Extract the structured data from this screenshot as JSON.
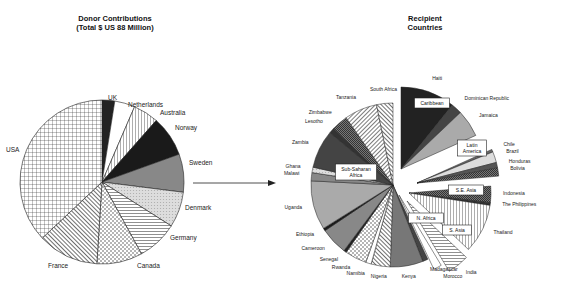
{
  "chart_data": [
    {
      "type": "pie",
      "title": "Donor Contributions",
      "subtitle": "(Total $ US 88 Million)",
      "categories": [
        "UK",
        "Netherlands",
        "Australia",
        "Norway",
        "Sweden",
        "Denmark",
        "Germany",
        "Canada",
        "France",
        "USA"
      ],
      "values": [
        2.5,
        4,
        5,
        8,
        7.5,
        7,
        8,
        9,
        12,
        37
      ],
      "unit": "percent (estimated)",
      "legend": "none (labels beside slices)"
    },
    {
      "type": "pie",
      "title": "Recipient Countries",
      "groups": [
        "Caribbean",
        "Latin America",
        "S.E. Asia",
        "S. Asia",
        "N. Africa",
        "Sub-Saharan Africa"
      ],
      "categories": [
        "Haiti",
        "Dominican Republic",
        "Jamaica",
        "Chile",
        "Brazil",
        "Honduras",
        "Bolivia",
        "Indonesia",
        "The Philippines",
        "Thailand",
        "India",
        "Morocco",
        "Madagascar",
        "Kenya",
        "Nigeria",
        "Namibia",
        "Rwanda",
        "Senegal",
        "Cameroon",
        "Ethiopia",
        "Uganda",
        "Malawi",
        "Ghana",
        "Zambia",
        "Lesotho",
        "Zimbabwe",
        "Tanzania",
        "South Africa"
      ],
      "group_of": [
        "Caribbean",
        "Caribbean",
        "Caribbean",
        "Latin America",
        "Latin America",
        "Latin America",
        "Latin America",
        "S.E. Asia",
        "S.E. Asia",
        "S.E. Asia",
        "S. Asia",
        "N. Africa",
        "Sub-Saharan Africa",
        "Sub-Saharan Africa",
        "Sub-Saharan Africa",
        "Sub-Saharan Africa",
        "Sub-Saharan Africa",
        "Sub-Saharan Africa",
        "Sub-Saharan Africa",
        "Sub-Saharan Africa",
        "Sub-Saharan Africa",
        "Sub-Saharan Africa",
        "Sub-Saharan Africa",
        "Sub-Saharan Africa",
        "Sub-Saharan Africa",
        "Sub-Saharan Africa",
        "Sub-Saharan Africa",
        "Sub-Saharan Africa"
      ],
      "values": [
        10,
        2,
        5,
        0.5,
        2,
        1,
        1.5,
        3,
        0.5,
        9,
        4,
        1.5,
        1,
        6,
        3.5,
        1,
        4,
        0.5,
        5,
        0.5,
        9,
        1.5,
        1,
        7,
        1,
        3,
        6,
        3
      ],
      "unit": "percent (estimated)",
      "exploded_groups": true
    }
  ],
  "left": {
    "title": "Donor Contributions",
    "subtitle": "(Total $ US 88 Million)"
  },
  "right": {
    "title_line1": "Recipient",
    "title_line2": "Countries"
  }
}
